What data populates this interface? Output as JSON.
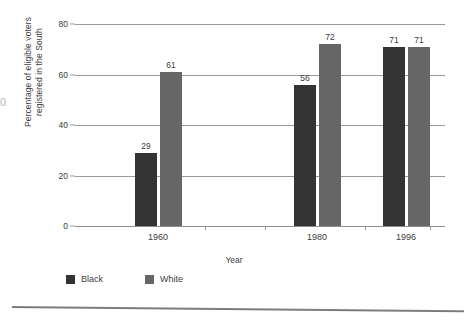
{
  "chart_data": {
    "type": "bar",
    "title": "",
    "subtitle": "",
    "xlabel": "Year",
    "ylabel": "Percentage of eligible voters\nregistered in the South",
    "categories": [
      "1960",
      "1980",
      "1996"
    ],
    "series": [
      {
        "name": "Black",
        "color": "#333333",
        "values": [
          29,
          56,
          71
        ]
      },
      {
        "name": "White",
        "color": "#666666",
        "values": [
          61,
          72,
          71
        ]
      }
    ],
    "ylim": [
      0,
      80
    ],
    "yticks": [
      0,
      20,
      40,
      60,
      80
    ],
    "grid": "horizontal",
    "legend_position": "bottom-left",
    "value_labels": true
  },
  "axis": {
    "y_title_line1": "Percentage of eligible voters",
    "y_title_line2": "registered in the South",
    "x_title": "Year",
    "y_tick_labels": [
      "0",
      "20",
      "40",
      "60",
      "80"
    ],
    "x_tick_labels": [
      "1960",
      "1980",
      "1996"
    ]
  },
  "bars": [
    {
      "group": "1960",
      "series": "Black",
      "value": 29,
      "label": "29",
      "color": "#333333"
    },
    {
      "group": "1960",
      "series": "White",
      "value": 61,
      "label": "61",
      "color": "#666666"
    },
    {
      "group": "1980",
      "series": "Black",
      "value": 56,
      "label": "56",
      "color": "#333333"
    },
    {
      "group": "1980",
      "series": "White",
      "value": 72,
      "label": "72",
      "color": "#666666"
    },
    {
      "group": "1996",
      "series": "Black",
      "value": 71,
      "label": "71",
      "color": "#333333"
    },
    {
      "group": "1996",
      "series": "White",
      "value": 71,
      "label": "71",
      "color": "#666666"
    }
  ],
  "legend": {
    "items": [
      {
        "label": "Black",
        "color": "#333333"
      },
      {
        "label": "White",
        "color": "#666666"
      }
    ]
  },
  "artifacts": {
    "left_edge_glyph": "0"
  }
}
